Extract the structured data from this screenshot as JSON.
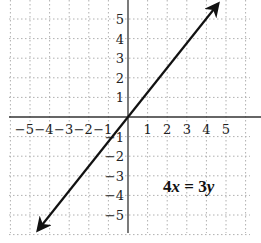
{
  "chart_data": {
    "type": "line",
    "title": "",
    "xlabel": "",
    "ylabel": "",
    "xlim": [
      -6,
      6
    ],
    "ylim": [
      -6,
      6
    ],
    "grid": true,
    "x_ticks": [
      "-5",
      "-4",
      "-3",
      "-2",
      "-1",
      "1",
      "2",
      "3",
      "4",
      "5"
    ],
    "y_ticks": [
      "5",
      "4",
      "3",
      "2",
      "1",
      "-1",
      "-2",
      "-3",
      "-4",
      "-5"
    ],
    "series": [
      {
        "name": "4x = 3y",
        "equation": "y = (4/3)x",
        "x": [
          -4.6,
          0,
          4.6
        ],
        "y": [
          -6,
          0,
          6
        ],
        "arrows_both_ends": true
      }
    ],
    "annotations": [
      {
        "text": "4x = 3y",
        "x": 3,
        "y": -3.6
      }
    ]
  },
  "equation_label": {
    "coef_x": "4",
    "var_x": "x",
    "eq": " = ",
    "coef_y": "3",
    "var_y": "y"
  },
  "colors": {
    "axis": "#333333",
    "grid": "#b0b0b0",
    "line": "#111111"
  }
}
